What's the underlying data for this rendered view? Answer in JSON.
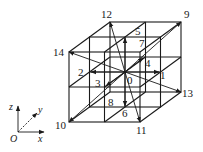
{
  "diagram": {
    "type": "D3Q15 lattice velocity diagram",
    "labels": [
      {
        "id": "0",
        "text": "0",
        "x": 127,
        "y": 84
      },
      {
        "id": "1",
        "text": "1",
        "x": 160,
        "y": 79
      },
      {
        "id": "2",
        "text": "2",
        "x": 78,
        "y": 76
      },
      {
        "id": "3",
        "text": "3",
        "x": 95,
        "y": 87
      },
      {
        "id": "4",
        "text": "4",
        "x": 145,
        "y": 67
      },
      {
        "id": "5",
        "text": "5",
        "x": 135,
        "y": 35
      },
      {
        "id": "6",
        "text": "6",
        "x": 122,
        "y": 117
      },
      {
        "id": "7",
        "text": "7",
        "x": 139,
        "y": 47
      },
      {
        "id": "8",
        "text": "8",
        "x": 108,
        "y": 106
      },
      {
        "id": "9",
        "text": "9",
        "x": 184,
        "y": 18
      },
      {
        "id": "10",
        "text": "10",
        "x": 55,
        "y": 129
      },
      {
        "id": "11",
        "text": "11",
        "x": 136,
        "y": 134
      },
      {
        "id": "12",
        "text": "12",
        "x": 101,
        "y": 18
      },
      {
        "id": "13",
        "text": "13",
        "x": 182,
        "y": 97
      },
      {
        "id": "14",
        "text": "14",
        "x": 53,
        "y": 56
      }
    ],
    "axes": {
      "origin_label": "O",
      "x_label": "x",
      "y_label": "y",
      "z_label": "z"
    },
    "colors": {
      "stroke": "#1a1a1a",
      "background": "#ffffff"
    }
  }
}
